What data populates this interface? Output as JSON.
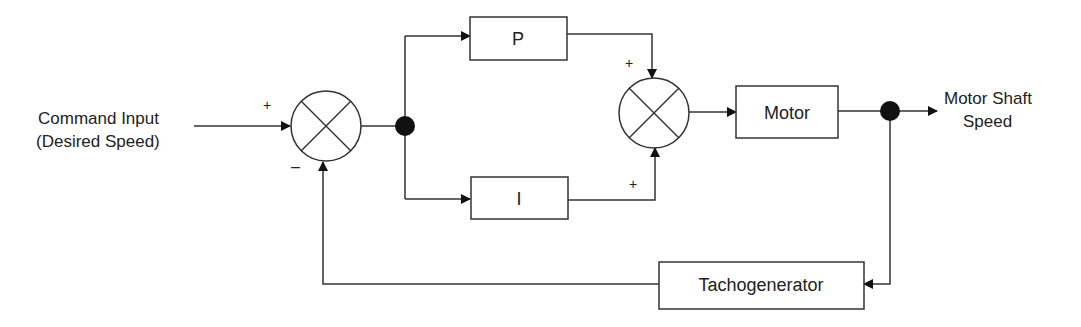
{
  "input": {
    "line1": "Command Input",
    "line2": "(Desired Speed)"
  },
  "output": {
    "line1": "Motor Shaft",
    "line2": "Speed"
  },
  "blocks": {
    "p": "P",
    "i": "I",
    "motor": "Motor",
    "tacho": "Tachogenerator"
  },
  "signs": {
    "sum1_input": "+",
    "sum1_feedback": "–",
    "sum2_top": "+",
    "sum2_bottom": "+"
  },
  "colors": {
    "line": "#333333",
    "background": "#ffffff"
  }
}
